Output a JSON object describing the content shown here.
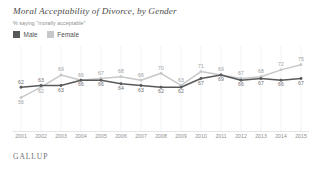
{
  "header": {
    "title": "Moral Acceptability of Divorce, by Gender",
    "subtitle": "% saying \"morally acceptable\""
  },
  "legend": {
    "position": "top-left",
    "items": [
      {
        "label": "Male",
        "color": "#58595b",
        "swatch": "legend-swatch-male"
      },
      {
        "label": "Female",
        "color": "#c6c8ca",
        "swatch": "legend-swatch-female"
      }
    ]
  },
  "footer": {
    "brand": "GALLUP"
  },
  "chart_data": {
    "type": "line",
    "title": "Moral Acceptability of Divorce, by Gender",
    "subtitle": "% saying \"morally acceptable\"",
    "xlabel": "",
    "ylabel": "",
    "ylim": [
      50,
      80
    ],
    "grid": true,
    "legend_position": "top-left",
    "categories": [
      "2001",
      "2002",
      "2003",
      "2004",
      "2005",
      "2006",
      "2007",
      "2008",
      "2009",
      "2010",
      "2011",
      "2012",
      "2013",
      "2014",
      "2015"
    ],
    "series": [
      {
        "name": "Male",
        "color": "#58595b",
        "values": [
          62,
          63,
          63,
          66,
          66,
          64,
          63,
          62,
          62,
          67,
          69,
          66,
          67,
          66,
          67
        ]
      },
      {
        "name": "Female",
        "color": "#c6c8ca",
        "values": [
          56,
          62,
          69,
          66,
          67,
          68,
          66,
          70,
          63,
          71,
          69,
          67,
          68,
          72,
          75
        ]
      }
    ]
  }
}
